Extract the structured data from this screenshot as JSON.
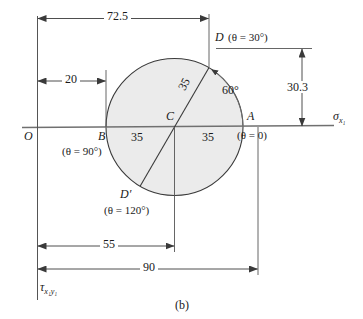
{
  "figure": {
    "caption": "(b)",
    "type": "mohrs-circle-diagram"
  },
  "axes": {
    "horizontal_axis_label": "σ",
    "horizontal_axis_subscript": "x₁",
    "vertical_axis_label": "τ",
    "vertical_axis_subscript": "x₁y₁",
    "origin_label": "O"
  },
  "points": {
    "center": {
      "label": "C"
    },
    "a": {
      "label": "A",
      "angle_note": "(θ = 0)"
    },
    "b": {
      "label": "B",
      "angle_note": "(θ = 90°)"
    },
    "d": {
      "label": "D",
      "angle_note": "(θ = 30°)"
    },
    "dprime": {
      "label": "D′",
      "angle_note": "(θ = 120°)"
    }
  },
  "dimensions": {
    "top_overall": "72.5",
    "left_offset": "20",
    "radius_left": "35",
    "radius_right": "35",
    "radius_diagonal": "35",
    "vertical_right": "30.3",
    "bottom_inner": "55",
    "bottom_overall": "90"
  },
  "angles": {
    "arc_label": "60°"
  },
  "colors": {
    "circle_fill": "#ebebeb",
    "stroke": "#3a3a3a",
    "text": "#1a1a1a"
  }
}
